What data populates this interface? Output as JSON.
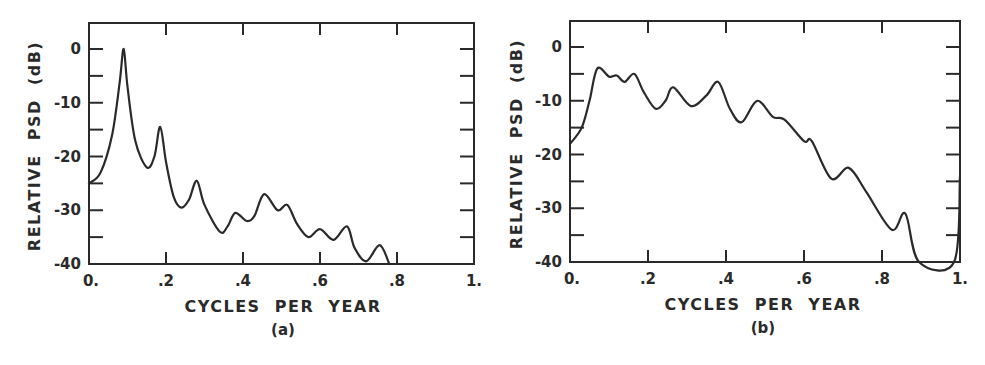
{
  "chart_data": [
    {
      "type": "line",
      "panel": "(a)",
      "title": "",
      "xlabel": "CYCLES PER YEAR",
      "ylabel": "RELATIVE PSD (dB)",
      "xlim": [
        0,
        1
      ],
      "ylim": [
        -40,
        5
      ],
      "xticks": [
        0,
        0.2,
        0.4,
        0.6,
        0.8,
        1.0
      ],
      "xtick_labels": [
        "0.",
        ".2",
        ".4",
        ".6",
        ".8",
        "1."
      ],
      "yticks": [
        0,
        -10,
        -20,
        -30,
        -40
      ],
      "ytick_labels": [
        "0",
        "-10",
        "-20",
        "-30",
        "-40"
      ],
      "minor_yticks": [
        -5,
        -15,
        -25,
        -35
      ],
      "grid": false,
      "series": [
        {
          "name": "PSD (a)",
          "x": [
            0.0,
            0.03,
            0.06,
            0.08,
            0.09,
            0.1,
            0.12,
            0.15,
            0.17,
            0.185,
            0.2,
            0.22,
            0.24,
            0.26,
            0.28,
            0.3,
            0.34,
            0.36,
            0.38,
            0.41,
            0.43,
            0.455,
            0.49,
            0.515,
            0.54,
            0.57,
            0.6,
            0.635,
            0.67,
            0.69,
            0.72,
            0.755,
            0.78
          ],
          "values": [
            -25,
            -23,
            -16,
            -6,
            0,
            -7,
            -17,
            -22,
            -20,
            -14.5,
            -21,
            -27.5,
            -29.5,
            -28,
            -24.5,
            -29,
            -34,
            -33,
            -30.5,
            -32,
            -31,
            -27,
            -30,
            -29,
            -32.5,
            -35,
            -33.5,
            -35.5,
            -33,
            -37,
            -39.5,
            -36.5,
            -40
          ]
        }
      ]
    },
    {
      "type": "line",
      "panel": "(b)",
      "title": "",
      "xlabel": "CYCLES PER YEAR",
      "ylabel": "RELATIVE PSD (dB)",
      "xlim": [
        0,
        1
      ],
      "ylim": [
        -40,
        5
      ],
      "xticks": [
        0,
        0.2,
        0.4,
        0.6,
        0.8,
        1.0
      ],
      "xtick_labels": [
        "0.",
        ".2",
        ".4",
        ".6",
        ".8",
        "1."
      ],
      "yticks": [
        0,
        -10,
        -20,
        -30,
        -40
      ],
      "ytick_labels": [
        "0",
        "-10",
        "-20",
        "-30",
        "-40"
      ],
      "minor_yticks": [
        -5,
        -15,
        -25,
        -35
      ],
      "grid": false,
      "series": [
        {
          "name": "PSD (b)",
          "x": [
            0.0,
            0.03,
            0.05,
            0.07,
            0.1,
            0.12,
            0.14,
            0.165,
            0.19,
            0.22,
            0.245,
            0.265,
            0.31,
            0.35,
            0.38,
            0.41,
            0.44,
            0.48,
            0.52,
            0.55,
            0.6,
            0.62,
            0.67,
            0.715,
            0.76,
            0.825,
            0.86,
            0.895,
            0.985,
            1.0
          ],
          "values": [
            -18,
            -15,
            -10,
            -4,
            -5.5,
            -5.3,
            -6.5,
            -5,
            -8.5,
            -11.5,
            -10,
            -7.5,
            -11,
            -9,
            -6.5,
            -11.5,
            -14,
            -10,
            -13,
            -13.5,
            -17.5,
            -17.5,
            -24.5,
            -22.5,
            -27,
            -34,
            -31,
            -40,
            -40,
            -24
          ]
        }
      ]
    }
  ],
  "panels": {
    "a": {
      "ylabel": "RELATIVE  PSD  (dB)",
      "xlabel": "CYCLES  PER  YEAR",
      "caption": "(a)",
      "xtick_labels": [
        "0.",
        ".2",
        ".4",
        ".6",
        ".8",
        "1."
      ],
      "ytick_labels": [
        "0",
        "-10",
        "-20",
        "-30",
        "-40"
      ]
    },
    "b": {
      "ylabel": "RELATIVE  PSD  (dB)",
      "xlabel": "CYCLES  PER  YEAR",
      "caption": "(b)",
      "xtick_labels": [
        "0.",
        ".2",
        ".4",
        ".6",
        ".8",
        "1."
      ],
      "ytick_labels": [
        "0",
        "-10",
        "-20",
        "-30",
        "-40"
      ]
    }
  },
  "colors": {
    "line": "#2a2a2a",
    "background": "#ffffff"
  }
}
